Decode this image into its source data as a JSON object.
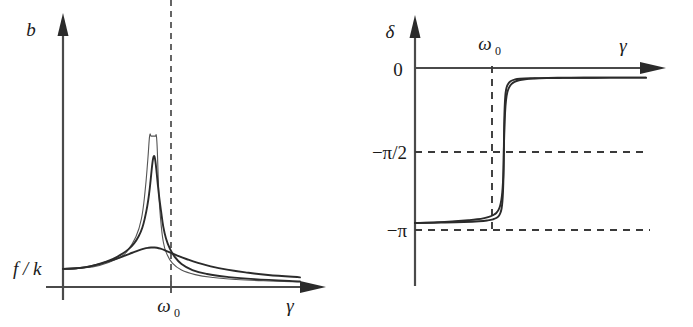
{
  "figure": {
    "background": "#ffffff",
    "ink_color": "#2b2b2b",
    "axis_color": "#4a4a4a"
  },
  "chart_data": [
    {
      "type": "line",
      "id": "amplitude-resonance",
      "title": "",
      "xlabel": "γ",
      "ylabel": "b",
      "grid": false,
      "legend": "none",
      "xtick_labels": [
        "ω₀"
      ],
      "ytick_labels": [
        "f / k"
      ],
      "xlim": [
        0,
        2.6
      ],
      "ylim": [
        0,
        1.12
      ],
      "annotations": [
        {
          "text": "b",
          "role": "y-axis-label"
        },
        {
          "text": "γ",
          "role": "x-axis-label"
        },
        {
          "text": "f / k",
          "role": "y-tick-zero-frequency-amplitude"
        },
        {
          "text": "ω",
          "sub": "0",
          "role": "x-tick-resonance"
        }
      ],
      "series": [
        {
          "name": "undamped",
          "damping": 0.0,
          "style": "thin",
          "description": "resonance peak diverges to infinity at gamma = omega_0",
          "x": [
            0.0,
            0.2,
            0.4,
            0.6,
            0.7,
            0.8,
            0.86,
            0.9,
            0.93,
            0.95,
            0.965,
            0.975,
            0.985,
            0.992,
            0.996,
            0.999,
            1.001,
            1.004,
            1.008,
            1.015,
            1.025,
            1.035,
            1.05,
            1.07,
            1.1,
            1.14,
            1.2,
            1.3,
            1.45,
            1.65,
            1.9,
            2.2,
            2.6
          ],
          "y": [
            0.12,
            0.125,
            0.143,
            0.188,
            0.235,
            0.333,
            0.452,
            0.632,
            0.84,
            1.0,
            1.0,
            1.0,
            1.0,
            1.0,
            1.0,
            1.0,
            1.0,
            1.0,
            1.0,
            1.0,
            1.0,
            0.9,
            0.64,
            0.455,
            0.3,
            0.218,
            0.158,
            0.112,
            0.082,
            0.063,
            0.05,
            0.041,
            0.034
          ]
        },
        {
          "name": "light-damping",
          "damping": 0.055,
          "style": "thick",
          "peak_value": 0.86,
          "x": [
            0.0,
            0.15,
            0.3,
            0.45,
            0.55,
            0.65,
            0.72,
            0.78,
            0.83,
            0.87,
            0.9,
            0.925,
            0.945,
            0.96,
            0.972,
            0.982,
            0.99,
            0.996,
            1.0,
            1.004,
            1.01,
            1.018,
            1.028,
            1.04,
            1.055,
            1.075,
            1.1,
            1.13,
            1.17,
            1.22,
            1.3,
            1.42,
            1.58,
            1.8,
            2.1,
            2.6
          ],
          "y": [
            0.12,
            0.124,
            0.137,
            0.163,
            0.186,
            0.22,
            0.251,
            0.289,
            0.336,
            0.393,
            0.462,
            0.538,
            0.62,
            0.7,
            0.772,
            0.826,
            0.856,
            0.866,
            0.868,
            0.864,
            0.848,
            0.812,
            0.754,
            0.68,
            0.598,
            0.506,
            0.4,
            0.322,
            0.257,
            0.205,
            0.152,
            0.112,
            0.086,
            0.067,
            0.052,
            0.037
          ]
        },
        {
          "name": "heavy-damping",
          "damping": 0.28,
          "style": "thick",
          "peak_value": 0.26,
          "x": [
            0.0,
            0.12,
            0.25,
            0.38,
            0.5,
            0.6,
            0.68,
            0.76,
            0.83,
            0.89,
            0.94,
            0.97,
            1.0,
            1.03,
            1.07,
            1.12,
            1.18,
            1.26,
            1.36,
            1.48,
            1.62,
            1.8,
            2.0,
            2.25,
            2.6
          ],
          "y": [
            0.12,
            0.123,
            0.132,
            0.148,
            0.17,
            0.19,
            0.208,
            0.227,
            0.243,
            0.254,
            0.26,
            0.262,
            0.262,
            0.26,
            0.254,
            0.243,
            0.228,
            0.207,
            0.184,
            0.16,
            0.137,
            0.115,
            0.097,
            0.08,
            0.064
          ]
        }
      ]
    },
    {
      "type": "line",
      "id": "phase-resonance",
      "title": "",
      "xlabel": "γ",
      "ylabel": "δ",
      "grid": false,
      "legend": "none",
      "xtick_labels": [
        "ω₀"
      ],
      "ytick_labels": [
        "0",
        "−π/2",
        "−π"
      ],
      "xlim": [
        0,
        2.6
      ],
      "ylim": [
        -3.35,
        0.15
      ],
      "annotations": [
        {
          "text": "δ",
          "role": "y-axis-label"
        },
        {
          "text": "γ",
          "role": "x-axis-label"
        },
        {
          "text": "0",
          "role": "y-tick-zero"
        },
        {
          "text": "−π/2",
          "role": "y-tick-half-pi"
        },
        {
          "text": "−π",
          "role": "y-tick-pi"
        },
        {
          "text": "ω",
          "sub": "0",
          "role": "x-tick-resonance"
        }
      ],
      "reference_lines": [
        {
          "name": "minus-half-pi",
          "value": -1.5708,
          "style": "dashed",
          "orientation": "horizontal"
        },
        {
          "name": "minus-pi",
          "value": -3.1416,
          "style": "dashed",
          "orientation": "horizontal"
        },
        {
          "name": "omega0-step",
          "value": 1.0,
          "style": "dashed",
          "orientation": "vertical",
          "description": "undamped limit: phase jumps from 0 to -pi at gamma = omega_0"
        }
      ],
      "series": [
        {
          "name": "light-damping",
          "damping": 0.012,
          "style": "thick",
          "x": [
            0.0,
            0.3,
            0.55,
            0.72,
            0.82,
            0.88,
            0.92,
            0.945,
            0.962,
            0.975,
            0.984,
            0.991,
            0.996,
            0.999,
            1.0,
            1.001,
            1.004,
            1.009,
            1.016,
            1.025,
            1.038,
            1.055,
            1.08,
            1.12,
            1.18,
            1.3,
            1.5,
            1.8,
            2.2,
            2.6
          ],
          "y": [
            0.0,
            -0.01,
            -0.022,
            -0.038,
            -0.058,
            -0.082,
            -0.114,
            -0.158,
            -0.222,
            -0.32,
            -0.47,
            -0.7,
            -1.01,
            -1.38,
            -1.5708,
            -1.76,
            -2.14,
            -2.5,
            -2.74,
            -2.88,
            -2.97,
            -3.025,
            -3.07,
            -3.1,
            -3.118,
            -3.13,
            -3.137,
            -3.14,
            -3.141,
            -3.1416
          ]
        },
        {
          "name": "moderate-damping",
          "damping": 0.055,
          "style": "thick",
          "x": [
            0.0,
            0.25,
            0.45,
            0.6,
            0.7,
            0.78,
            0.84,
            0.88,
            0.915,
            0.94,
            0.958,
            0.972,
            0.982,
            0.99,
            0.996,
            1.0,
            1.006,
            1.014,
            1.025,
            1.04,
            1.06,
            1.085,
            1.12,
            1.17,
            1.24,
            1.34,
            1.48,
            1.66,
            1.9,
            2.2,
            2.6
          ],
          "y": [
            0.0,
            -0.018,
            -0.04,
            -0.062,
            -0.082,
            -0.108,
            -0.138,
            -0.172,
            -0.218,
            -0.285,
            -0.375,
            -0.5,
            -0.66,
            -0.88,
            -1.18,
            -1.5708,
            -2.0,
            -2.39,
            -2.66,
            -2.83,
            -2.93,
            -3.0,
            -3.05,
            -3.085,
            -3.108,
            -3.122,
            -3.131,
            -3.136,
            -3.139,
            -3.141,
            -3.1416
          ]
        }
      ]
    }
  ],
  "panels": {
    "amplitude": {
      "y_axis_label": "b",
      "x_axis_label": "γ",
      "baseline_label": "f / k",
      "resonance_label": "ω",
      "resonance_sub": "0"
    },
    "phase": {
      "y_axis_label": "δ",
      "x_axis_label": "γ",
      "zero_label": "0",
      "half_pi_label": "−π/2",
      "pi_label": "−π",
      "resonance_label": "ω",
      "resonance_sub": "0"
    }
  }
}
